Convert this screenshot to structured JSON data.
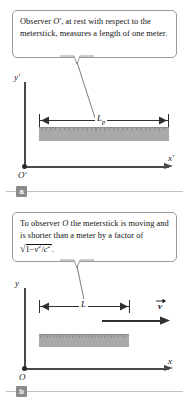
{
  "figure": {
    "background_color": "#ffffff",
    "stick_color": "#a9a9a9",
    "axis_color": "#4a4a4a",
    "callout_border_color": "#9a9a9a",
    "tag_color": "#8c8c8c"
  },
  "panels": [
    {
      "tag": "a",
      "callout": {
        "line1_pre": "Observer ",
        "line1_sym": "O′",
        "line1_post": ", at rest with respect",
        "line2": "to the meterstick, measures a",
        "line3": "length of one meter."
      },
      "axes": {
        "y_label": "y′",
        "x_label": "x′",
        "origin_label": "O′"
      },
      "dimension": {
        "label_base": "L",
        "label_sub": "p"
      },
      "meterstick": {
        "description": "ruler at rest, proper length one meter"
      }
    },
    {
      "tag": "b",
      "callout": {
        "line1_pre": "To observer ",
        "line1_sym": "O",
        "line1_post": " the meterstick is",
        "line2": "moving and is shorter than a",
        "line3_pre": "meter by a factor of ",
        "formula": {
          "radical": "√",
          "one": "1",
          "minus": "−",
          "v": "v",
          "v_exp": "2",
          "slash": "/",
          "c": "c",
          "c_exp": "2",
          "period": "."
        }
      },
      "axes": {
        "y_label": "y",
        "x_label": "x",
        "origin_label": "O"
      },
      "dimension": {
        "label_base": "L",
        "label_sub": ""
      },
      "velocity": {
        "label": "v"
      },
      "meterstick": {
        "description": "ruler moving to the right, contracted"
      }
    }
  ]
}
